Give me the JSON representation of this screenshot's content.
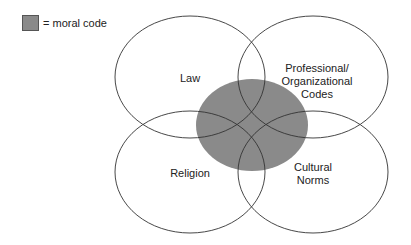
{
  "legend": {
    "label": "= moral code",
    "swatch_color": "#8a8a8a"
  },
  "diagram": {
    "type": "venn",
    "sets": [
      {
        "name": "law",
        "lines": [
          "Law"
        ]
      },
      {
        "name": "professional",
        "lines": [
          "Professional/",
          "Organizational",
          "Codes"
        ]
      },
      {
        "name": "religion",
        "lines": [
          "Religion"
        ]
      },
      {
        "name": "cultural",
        "lines": [
          "Cultural",
          "Norms"
        ]
      }
    ],
    "center": {
      "name": "moral code",
      "color": "#8a8a8a"
    }
  }
}
